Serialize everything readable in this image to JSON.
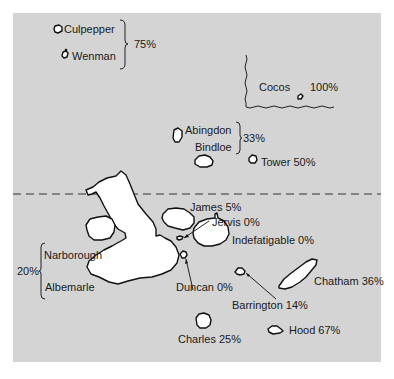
{
  "map": {
    "type": "island-map",
    "background_color": "#d4d4d4",
    "island_color": "#ffffff",
    "equator_line": "dashed",
    "islands": [
      {
        "name": "Culpepper",
        "group_value": "75%"
      },
      {
        "name": "Wenman",
        "group_value": "75%"
      },
      {
        "name": "Cocos",
        "value": "100%"
      },
      {
        "name": "Abingdon",
        "group_value": "33%"
      },
      {
        "name": "Bindloe",
        "group_value": "33%"
      },
      {
        "name": "Tower",
        "value": "50%"
      },
      {
        "name": "James",
        "value": "5%"
      },
      {
        "name": "Jervis",
        "value": "0%"
      },
      {
        "name": "Indefatigable",
        "value": "0%"
      },
      {
        "name": "Narborough",
        "group_value": "20%"
      },
      {
        "name": "Albemarle",
        "group_value": "20%"
      },
      {
        "name": "Duncan",
        "value": "0%"
      },
      {
        "name": "Barrington",
        "value": "14%"
      },
      {
        "name": "Chatham",
        "value": "36%"
      },
      {
        "name": "Charles",
        "value": "25%"
      },
      {
        "name": "Hood",
        "value": "67%"
      }
    ]
  },
  "labels": {
    "culpepper": "Culpepper",
    "wenman": "Wenman",
    "group_north": "75%",
    "cocos": "Cocos",
    "cocos_pct": "100%",
    "abingdon": "Abingdon",
    "bindloe": "Bindloe",
    "group_mid": "33%",
    "tower": "Tower 50%",
    "james": "James 5%",
    "jervis": "Jervis 0%",
    "indefatigable": "Indefatigable 0%",
    "narborough": "Narborough",
    "albemarle": "Albemarle",
    "group_west": "20%",
    "duncan": "Duncan 0%",
    "barrington": "Barrington 14%",
    "chatham": "Chatham 36%",
    "charles": "Charles 25%",
    "hood": "Hood 67%"
  }
}
